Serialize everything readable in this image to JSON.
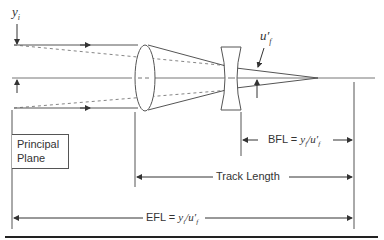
{
  "diagram": {
    "labels": {
      "yi": "y",
      "yi_sub": "i",
      "uf": "u′",
      "uf_sub": "f",
      "principal_plane_line1": "Principal",
      "principal_plane_line2": "Plane",
      "bfl": "BFL = ",
      "bfl_formula": "y",
      "bfl_sub1": "f",
      "bfl_slash": "/u′",
      "bfl_sub2": "f",
      "track_length": "Track Length",
      "efl": "EFL = ",
      "efl_formula": "y",
      "efl_sub1": "i",
      "efl_slash": "/u′",
      "efl_sub2": "f"
    },
    "colors": {
      "line": "#555555",
      "text": "#333333"
    }
  }
}
